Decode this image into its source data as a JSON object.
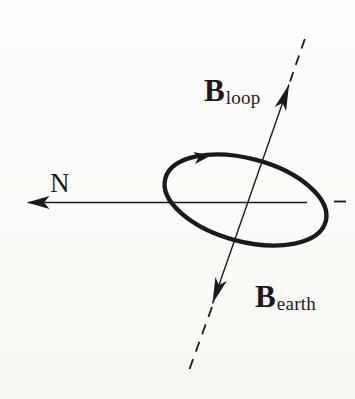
{
  "figure": {
    "labels": {
      "north": "N",
      "b_loop": {
        "base": "B",
        "sub": "loop"
      },
      "b_earth": {
        "base": "B",
        "sub": "earth"
      }
    },
    "colors": {
      "ink": "#1a1a1a",
      "background": "#fcfcfa"
    }
  }
}
